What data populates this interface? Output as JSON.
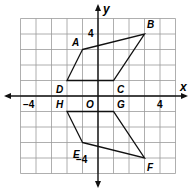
{
  "diagram": {
    "type": "coordinate-plane",
    "axes": {
      "x_label": "x",
      "y_label": "y",
      "origin_label": "O"
    },
    "tick_labels": {
      "x_neg": "−4",
      "x_pos": "4",
      "y_pos": "4",
      "y_neg": "−4"
    },
    "grid": {
      "x_min": -5,
      "x_max": 5,
      "y_min": -5,
      "y_max": 5
    },
    "quadrilaterals": [
      {
        "name": "ABCD",
        "vertices": [
          {
            "label": "A",
            "x": -1,
            "y": 3
          },
          {
            "label": "B",
            "x": 3,
            "y": 4
          },
          {
            "label": "C",
            "x": 1,
            "y": 1
          },
          {
            "label": "D",
            "x": -2,
            "y": 1
          }
        ]
      },
      {
        "name": "EFGH",
        "vertices": [
          {
            "label": "E",
            "x": -1,
            "y": -3
          },
          {
            "label": "F",
            "x": 3,
            "y": -4
          },
          {
            "label": "G",
            "x": 1,
            "y": -1
          },
          {
            "label": "H",
            "x": -2,
            "y": -1
          }
        ]
      }
    ],
    "colors": {
      "grid": "#9a9a9a",
      "axis": "#111111",
      "shape": "#111111"
    }
  }
}
